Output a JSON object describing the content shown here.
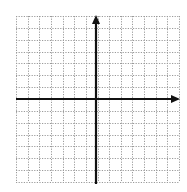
{
  "diagram": {
    "type": "coordinate-plane",
    "grid": {
      "columns": 14,
      "rows": 14,
      "style": "dotted",
      "color": "#9a9a9a",
      "left": 16,
      "top": 16,
      "right": 179,
      "bottom": 182
    },
    "axes": {
      "color": "#111111",
      "origin_x": 96,
      "origin_y": 99,
      "x_axis_arrow": "right",
      "y_axis_arrow": "up",
      "labels": []
    },
    "background": "#ffffff"
  }
}
